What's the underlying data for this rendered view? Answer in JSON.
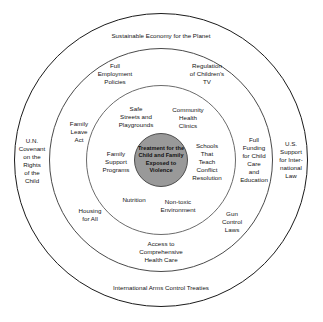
{
  "diagram": {
    "type": "concentric-circles",
    "core": {
      "label": "Treatment for the Child and Family Exposed to Violence",
      "fill_color": "#999999",
      "text_color": "#111111"
    },
    "rings": [
      {
        "name": "inner-ring",
        "level": 1,
        "items": [
          {
            "label": "Safe\nStreets and\nPlaygrounds",
            "angle_deg": 315
          },
          {
            "label": "Community\nHealth\nClinics",
            "angle_deg": 45
          },
          {
            "label": "Schools\nThat\nTeach\nConflict\nResolution",
            "angle_deg": 20
          },
          {
            "label": "Non-toxic\nEnvironment",
            "angle_deg": 70
          },
          {
            "label": "Nutrition",
            "angle_deg": 115
          },
          {
            "label": "Family\nSupport\nPrograms",
            "angle_deg": 200
          }
        ]
      },
      {
        "name": "middle-ring",
        "level": 2,
        "items": [
          {
            "label": "Full\nEmployment\nPolicies",
            "angle_deg": 300
          },
          {
            "label": "Regulation\nof Children's\nTV",
            "angle_deg": 60
          },
          {
            "label": "Full\nFunding\nfor Child\nCare\nand\nEducation",
            "angle_deg": 0
          },
          {
            "label": "Gun\nControl\nLaws",
            "angle_deg": 45
          },
          {
            "label": "Access to\nComprehensive\nHealth Care",
            "angle_deg": 90
          },
          {
            "label": "Housing\nfor All",
            "angle_deg": 135
          },
          {
            "label": "Family\nLeave\nAct",
            "angle_deg": 205
          }
        ]
      },
      {
        "name": "outer-ring",
        "level": 3,
        "items": [
          {
            "label": "Sustainable Economy for the Planet",
            "angle_deg": 270
          },
          {
            "label": "U.S. Support\nfor Inter-\nnational\nLaw",
            "angle_deg": 0
          },
          {
            "label": "International Arms Control Treaties",
            "angle_deg": 90
          },
          {
            "label": "U.N.\nCovenant\non the\nRights\nof the\nChild",
            "angle_deg": 180
          }
        ]
      }
    ]
  }
}
